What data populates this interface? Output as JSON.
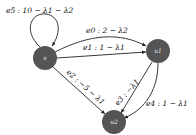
{
  "diagram": {
    "type": "directed-graph",
    "node_color": "#555555",
    "nodes": [
      {
        "id": "s",
        "label": "s"
      },
      {
        "id": "u1",
        "label": "u1"
      },
      {
        "id": "u2",
        "label": "u2"
      }
    ],
    "edges": [
      {
        "id": "e0",
        "from": "s",
        "to": "u1",
        "label": "e0 : 2 − λ2"
      },
      {
        "id": "e1",
        "from": "s",
        "to": "u1",
        "label": "e1 : 1 − λ1"
      },
      {
        "id": "e2",
        "from": "s",
        "to": "u2",
        "label": "e2 : −5 − λ1"
      },
      {
        "id": "e3",
        "from": "u1",
        "to": "u2",
        "label": "e3 : −λ1"
      },
      {
        "id": "e4",
        "from": "u1",
        "to": "u2",
        "label": "e4 : 1 − λ1"
      },
      {
        "id": "e5",
        "from": "s",
        "to": "s",
        "label": "e5 : 10 − λ1 − λ2"
      }
    ]
  }
}
